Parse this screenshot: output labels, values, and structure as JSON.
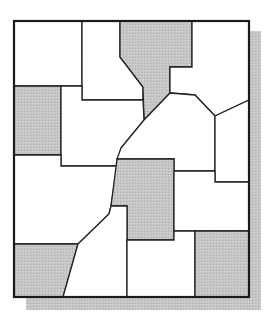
{
  "map": {
    "width": 264,
    "height": 316,
    "colors": {
      "background": "#ffffff",
      "filled": "#c4c4c4",
      "empty": "#ffffff",
      "stroke": "#222222",
      "shadow": "#c8c8c8"
    },
    "frame": {
      "x": 14,
      "y": 21,
      "width": 235,
      "height": 276
    },
    "shadow": {
      "right": {
        "x": 250,
        "y": 31,
        "width": 11,
        "height": 279
      },
      "bottom": {
        "x": 26,
        "y": 298,
        "width": 235,
        "height": 12
      }
    },
    "regions": [
      {
        "id": "r1",
        "shaded": false,
        "points": "14,21 82,21 82,86 14,86"
      },
      {
        "id": "r2",
        "shaded": false,
        "points": "82,21 120,21 120,57 143,87 143,100 82,100"
      },
      {
        "id": "r3",
        "shaded": true,
        "points": "120,21 192,21 192,67 170,67 170,93 144,120 143,87 120,57"
      },
      {
        "id": "r4",
        "shaded": false,
        "points": "192,21 249,21 249,100 215,116 195,95 170,93 170,67 192,67"
      },
      {
        "id": "r5",
        "shaded": true,
        "points": "14,86 61,86 61,155 14,155"
      },
      {
        "id": "r6",
        "shaded": false,
        "points": "61,86 82,86 82,100 143,100 144,120 121,148 117,166 61,166"
      },
      {
        "id": "r7",
        "shaded": false,
        "points": "170,93 195,95 215,116 215,171 174,171 174,159 117,159 121,148 144,120"
      },
      {
        "id": "r8",
        "shaded": false,
        "points": "215,116 249,100 249,182 215,182"
      },
      {
        "id": "r9",
        "shaded": false,
        "points": "14,155 61,155 61,166 117,166 111,206 109,214 78,244 14,244"
      },
      {
        "id": "r10",
        "shaded": true,
        "points": "117,159 174,159 174,240 127,240 127,206 111,206"
      },
      {
        "id": "r11",
        "shaded": false,
        "points": "174,171 215,171 215,182 249,182 249,231 174,231"
      },
      {
        "id": "r12",
        "shaded": true,
        "points": "14,244 78,244 63,297 14,297"
      },
      {
        "id": "r13",
        "shaded": false,
        "points": "78,244 109,214 111,206 127,206 127,297 63,297"
      },
      {
        "id": "r14",
        "shaded": false,
        "points": "127,240 174,240 174,231 195,231 195,297 127,297"
      },
      {
        "id": "r15",
        "shaded": true,
        "points": "195,231 249,231 249,297 195,297"
      }
    ]
  }
}
